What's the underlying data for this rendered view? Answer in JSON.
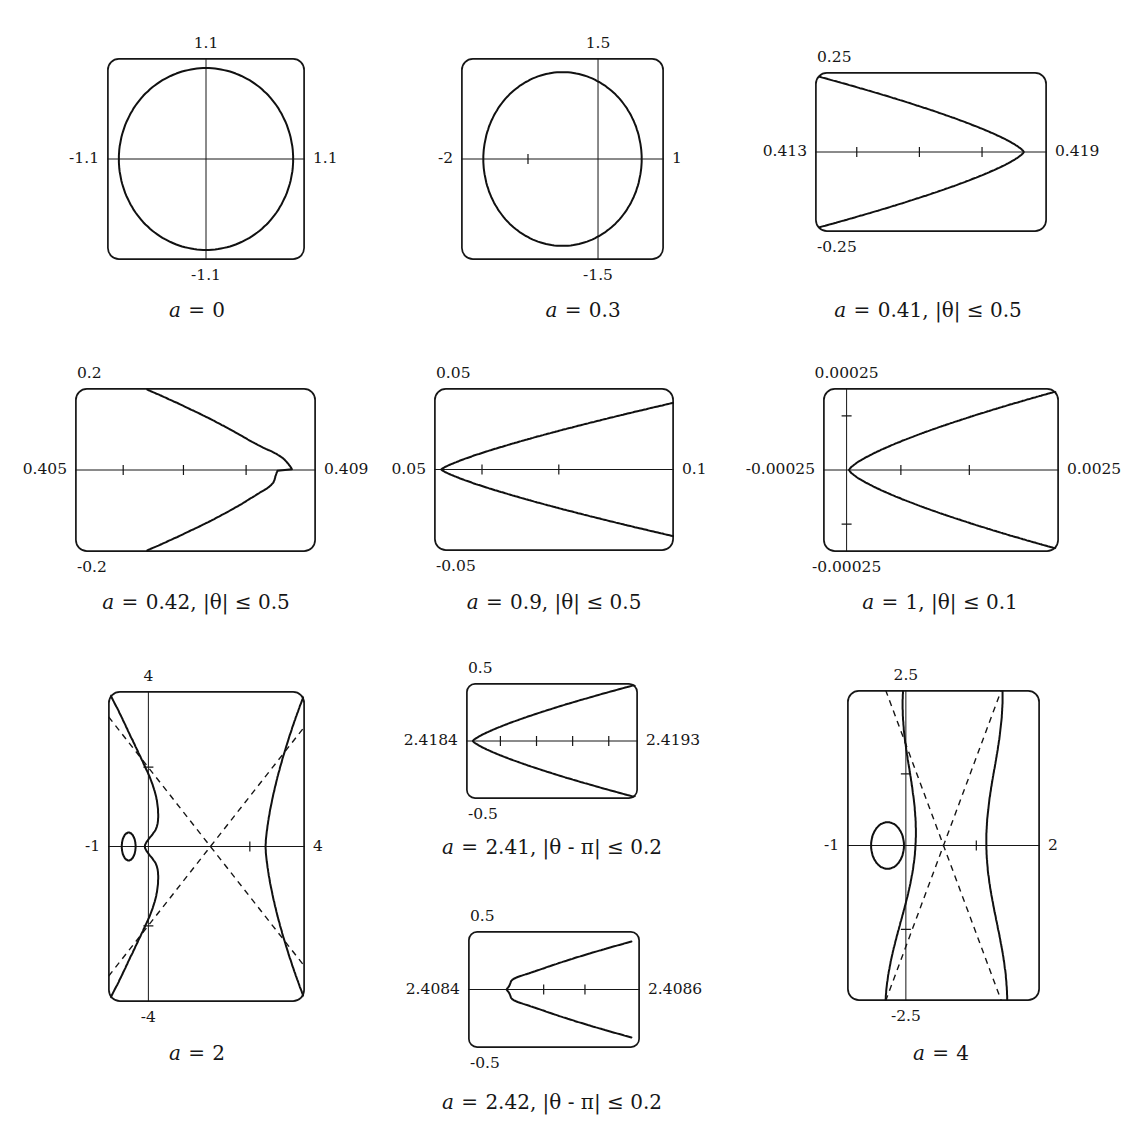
{
  "figure": {
    "title_fragment": "",
    "background": "#ffffff",
    "ink": "#161616",
    "curve_color": "#111111",
    "width": 1135,
    "height": 1147
  },
  "chart_data": {
    "type": "line",
    "title": "",
    "layout": {
      "rows": 3,
      "columns": 3,
      "legend": "none",
      "grid": false
    },
    "panels": [
      {
        "id": "panel-a0",
        "caption_parts": {
          "var": "a",
          "eq": "=",
          "value": "0",
          "range": ""
        },
        "caption_text": "a = 0",
        "frame": {
          "x": 107,
          "y": 58,
          "w": 198,
          "h": 202
        },
        "labels": {
          "top": "1.1",
          "left": "-1.1",
          "right": "1.1",
          "bottom": "-1.1"
        },
        "axes": {
          "vertical_frac": 0.5,
          "horizontal_frac": 0.5
        },
        "ticks": {
          "horizontal": [],
          "vertical": []
        },
        "shape": "circle",
        "shape_params": {
          "cx": 0.5,
          "cy": 0.5,
          "rx": 0.44,
          "ry": 0.45
        },
        "asymptotes": false
      },
      {
        "id": "panel-a03",
        "caption_parts": {
          "var": "a",
          "eq": "=",
          "value": "0.3",
          "range": ""
        },
        "caption_text": "a = 0.3",
        "frame": {
          "x": 461,
          "y": 58,
          "w": 203,
          "h": 202
        },
        "labels": {
          "top": "1.5",
          "left": "-2",
          "right": "1",
          "bottom": "-1.5"
        },
        "axes": {
          "vertical_frac": 0.675,
          "horizontal_frac": 0.5
        },
        "ticks": {
          "horizontal": [
            0.33
          ],
          "vertical": []
        },
        "shape": "circle",
        "shape_params": {
          "cx": 0.5,
          "cy": 0.5,
          "rx": 0.39,
          "ry": 0.43
        },
        "asymptotes": false
      },
      {
        "id": "panel-a041",
        "caption_parts": {
          "var": "a",
          "eq": "=",
          "value": "0.41",
          "range": "|θ| ≤ 0.5"
        },
        "caption_text": "a = 0.41, |θ| ≤ 0.5",
        "frame": {
          "x": 815,
          "y": 72,
          "w": 232,
          "h": 160
        },
        "labels": {
          "top": "0.25",
          "left": "0.413",
          "right": "0.419",
          "bottom": "-0.25"
        },
        "axes": {
          "vertical_frac": null,
          "horizontal_frac": 0.5
        },
        "ticks": {
          "horizontal": [
            0.18,
            0.45,
            0.72
          ],
          "vertical": []
        },
        "shape": "left-parabola",
        "shape_params": {
          "apex_x": 0.9,
          "mouth_x": 0.02,
          "top_y": 0.03,
          "bottom_y": 0.97,
          "wiggle": 0
        },
        "asymptotes": false
      },
      {
        "id": "panel-a042",
        "caption_parts": {
          "var": "a",
          "eq": "=",
          "value": "0.42",
          "range": "|θ| ≤ 0.5"
        },
        "caption_text": "a = 0.42,|θ| ≤ 0.5",
        "frame": {
          "x": 75,
          "y": 388,
          "w": 241,
          "h": 164
        },
        "labels": {
          "top": "0.2",
          "left": "0.405",
          "right": "0.409",
          "bottom": "-0.2"
        },
        "axes": {
          "vertical_frac": null,
          "horizontal_frac": 0.5
        },
        "ticks": {
          "horizontal": [
            0.2,
            0.45,
            0.71
          ],
          "vertical": []
        },
        "shape": "left-parabola",
        "shape_params": {
          "apex_x": 0.87,
          "mouth_x": 0.3,
          "top_y": 0.01,
          "bottom_y": 0.99,
          "wiggle": 1
        },
        "asymptotes": false
      },
      {
        "id": "panel-a09",
        "caption_parts": {
          "var": "a",
          "eq": "=",
          "value": "0.9",
          "range": "|θ| ≤ 0.5"
        },
        "caption_text": "a = 0.9, |θ| ≤ 0.5",
        "frame": {
          "x": 434,
          "y": 388,
          "w": 240,
          "h": 163
        },
        "labels": {
          "top": "0.05",
          "left": "0.05",
          "right": "0.1",
          "bottom": "-0.05"
        },
        "axes": {
          "vertical_frac": null,
          "horizontal_frac": 0.5
        },
        "ticks": {
          "horizontal": [
            0.2,
            0.52
          ],
          "vertical": []
        },
        "shape": "right-cusp",
        "shape_params": {
          "cusp_x": 0.03,
          "end_x": 1.0,
          "top_y": 0.09,
          "bottom_y": 0.91,
          "bow": 0.22
        },
        "asymptotes": false
      },
      {
        "id": "panel-a1",
        "caption_parts": {
          "var": "a",
          "eq": "=",
          "value": "1",
          "range": "|θ| ≤ 0.1"
        },
        "caption_text": "a = 1, |θ| ≤ 0.1",
        "frame": {
          "x": 823,
          "y": 388,
          "w": 236,
          "h": 164
        },
        "labels": {
          "top": "0.00025",
          "left": "-0.00025",
          "right": "0.0025",
          "bottom": "-0.00025"
        },
        "axes": {
          "vertical_frac": 0.1,
          "horizontal_frac": 0.5
        },
        "ticks": {
          "horizontal": [
            0.33,
            0.62
          ],
          "vertical": [
            0.17,
            0.83
          ]
        },
        "shape": "right-cusp",
        "shape_params": {
          "cusp_x": 0.11,
          "end_x": 0.99,
          "top_y": 0.02,
          "bottom_y": 0.98,
          "bow": 0.3
        },
        "asymptotes": false
      },
      {
        "id": "panel-a2",
        "caption_parts": {
          "var": "a",
          "eq": "=",
          "value": "2",
          "range": ""
        },
        "caption_text": "a = 2",
        "frame": {
          "x": 108,
          "y": 691,
          "w": 197,
          "h": 311
        },
        "labels": {
          "top": "4",
          "left": "-1",
          "right": "4",
          "bottom": "-4"
        },
        "axes": {
          "vertical_frac": 0.205,
          "horizontal_frac": 0.5
        },
        "ticks": {
          "horizontal": [
            0.72
          ],
          "vertical": [
            0.245,
            0.755
          ]
        },
        "shape": "hyperbola-loop",
        "shape_params": {
          "loop_cx": 0.105,
          "loop_cy": 0.5,
          "loop_r": 0.035,
          "left_branch_x": 0.225,
          "right_branch_x": 0.8
        },
        "asymptotes": true
      },
      {
        "id": "panel-a241",
        "caption_parts": {
          "var": "a",
          "eq": "=",
          "value": "2.41",
          "range": "|θ - π| ≤ 0.2"
        },
        "caption_text": "a = 2.41, |θ − π| ≤ 0.2",
        "frame": {
          "x": 466,
          "y": 683,
          "w": 172,
          "h": 116
        },
        "labels": {
          "top": "0.5",
          "left": "2.4184",
          "right": "2.4193",
          "bottom": "-0.5"
        },
        "axes": {
          "vertical_frac": null,
          "horizontal_frac": 0.5
        },
        "ticks": {
          "horizontal": [
            0.2,
            0.41,
            0.62,
            0.83
          ],
          "vertical": []
        },
        "shape": "right-parabola",
        "shape_params": {
          "apex_x": 0.04,
          "end_x": 1.0,
          "top_y": 0.01,
          "bottom_y": 0.99,
          "wiggle": 0
        },
        "asymptotes": false
      },
      {
        "id": "panel-a242",
        "caption_parts": {
          "var": "a",
          "eq": "=",
          "value": "2.42",
          "range": "|θ - π| ≤ 0.2"
        },
        "caption_text": "a = 2.42, |θ − π| ≤ 0.2",
        "frame": {
          "x": 468,
          "y": 931,
          "w": 172,
          "h": 117
        },
        "labels": {
          "top": "0.5",
          "left": "2.4084",
          "right": "2.4086",
          "bottom": "-0.5"
        },
        "axes": {
          "vertical_frac": null,
          "horizontal_frac": 0.5
        },
        "ticks": {
          "horizontal": [
            0.44,
            0.68
          ],
          "vertical": []
        },
        "shape": "right-parabola",
        "shape_params": {
          "apex_x": 0.17,
          "end_x": 0.95,
          "top_y": 0.09,
          "bottom_y": 0.91,
          "wiggle": 1
        },
        "asymptotes": false
      },
      {
        "id": "panel-a4",
        "caption_parts": {
          "var": "a",
          "eq": "=",
          "value": "4",
          "range": ""
        },
        "caption_text": "a = 4",
        "frame": {
          "x": 847,
          "y": 690,
          "w": 193,
          "h": 311
        },
        "labels": {
          "top": "2.5",
          "left": "-1",
          "right": "2",
          "bottom": "-2.5"
        },
        "axes": {
          "vertical_frac": 0.305,
          "horizontal_frac": 0.5
        },
        "ticks": {
          "horizontal": [
            0.67
          ],
          "vertical": [
            0.27,
            0.77
          ]
        },
        "shape": "wavy-loop",
        "shape_params": {
          "loop_cx": 0.21,
          "loop_cy": 0.5,
          "loop_rx": 0.085,
          "loop_ry": 0.075,
          "left_wave_x": 0.3,
          "right_wave_x": 0.77
        },
        "asymptotes": true
      }
    ]
  }
}
